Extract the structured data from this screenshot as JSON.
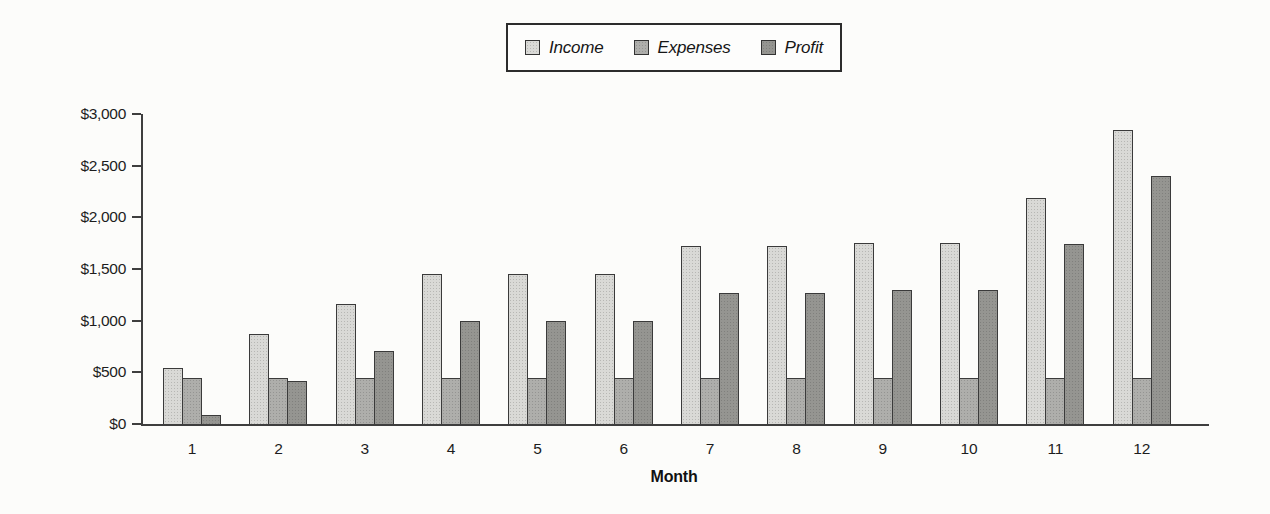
{
  "page": {
    "background_color": "#fcfcfa",
    "axis_color": "#3e3e3e",
    "bar_outline_color": "#3a3a3a",
    "text_color": "#1d1d1d"
  },
  "chart_data": {
    "type": "bar",
    "title": "",
    "xlabel": "Month",
    "ylabel": "",
    "categories": [
      "1",
      "2",
      "3",
      "4",
      "5",
      "6",
      "7",
      "8",
      "9",
      "10",
      "11",
      "12"
    ],
    "series": [
      {
        "name": "Income",
        "color": "#d9d9d6",
        "values": [
          540,
          870,
          1160,
          1450,
          1450,
          1450,
          1720,
          1720,
          1750,
          1750,
          2190,
          2850
        ]
      },
      {
        "name": "Expenses",
        "color": "#aeaeab",
        "values": [
          450,
          450,
          450,
          450,
          450,
          450,
          450,
          450,
          450,
          450,
          450,
          450
        ]
      },
      {
        "name": "Profit",
        "color": "#959591",
        "values": [
          90,
          420,
          710,
          1000,
          1000,
          1000,
          1270,
          1270,
          1300,
          1300,
          1740,
          2400
        ]
      }
    ],
    "ylim": [
      0,
      3000
    ],
    "y_tick_values": [
      0,
      500,
      1000,
      1500,
      2000,
      2500,
      3000
    ],
    "y_tick_labels": [
      "$0",
      "$500",
      "$1,000",
      "$1,500",
      "$2,000",
      "$2,500",
      "$3,000"
    ],
    "grid": false,
    "legend_position": "top-center"
  }
}
